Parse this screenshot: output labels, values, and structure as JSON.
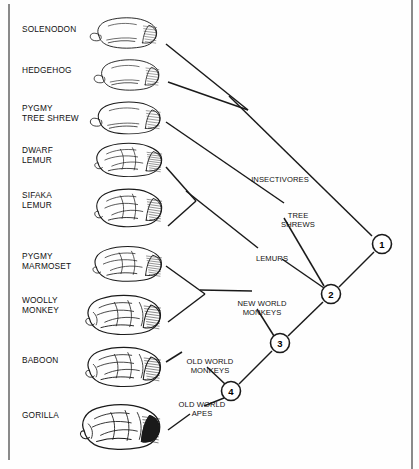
{
  "figure": {
    "type": "cladogram",
    "title": "",
    "background_color": "#fefefe",
    "line_color": "#1a1a1a",
    "text_color": "#111111"
  },
  "taxa": [
    {
      "id": "solenodon",
      "label": "SOLENODON",
      "label_x": 22,
      "label_y": 24,
      "brain_x": 88,
      "brain_y": 12,
      "brain_w": 78,
      "brain_h": 42,
      "tip_x": 166,
      "tip_y": 44
    },
    {
      "id": "hedgehog",
      "label": "HEDGEHOG",
      "label_x": 22,
      "label_y": 65,
      "brain_x": 92,
      "brain_y": 54,
      "brain_w": 76,
      "brain_h": 42,
      "tip_x": 168,
      "tip_y": 82
    },
    {
      "id": "pygmy-tree-shrew",
      "label": "PYGMY\nTREE SHREW",
      "label_x": 22,
      "label_y": 103,
      "brain_x": 88,
      "brain_y": 96,
      "brain_w": 82,
      "brain_h": 44,
      "tip_x": 166,
      "tip_y": 122
    },
    {
      "id": "dwarf-lemur",
      "label": "DWARF\nLEMUR",
      "label_x": 22,
      "label_y": 145,
      "brain_x": 86,
      "brain_y": 137,
      "brain_w": 86,
      "brain_h": 46,
      "tip_x": 166,
      "tip_y": 167
    },
    {
      "id": "sifaka-lemur",
      "label": "SIFAKA\nLEMUR",
      "label_x": 22,
      "label_y": 190,
      "brain_x": 86,
      "brain_y": 182,
      "brain_w": 86,
      "brain_h": 52,
      "tip_x": 168,
      "tip_y": 226
    },
    {
      "id": "pygmy-marmoset",
      "label": "PYGMY\nMARMOSET",
      "label_x": 22,
      "label_y": 251,
      "brain_x": 84,
      "brain_y": 240,
      "brain_w": 88,
      "brain_h": 48,
      "tip_x": 166,
      "tip_y": 266
    },
    {
      "id": "woolly-monkey",
      "label": "WOOLLY\nMONKEY",
      "label_x": 22,
      "label_y": 295,
      "brain_x": 76,
      "brain_y": 288,
      "brain_w": 96,
      "brain_h": 54,
      "tip_x": 168,
      "tip_y": 322
    },
    {
      "id": "baboon",
      "label": "BABOON",
      "label_x": 22,
      "label_y": 355,
      "brain_x": 76,
      "brain_y": 340,
      "brain_w": 96,
      "brain_h": 54,
      "tip_x": 166,
      "tip_y": 362
    },
    {
      "id": "gorilla",
      "label": "GORILLA",
      "label_x": 22,
      "label_y": 410,
      "brain_x": 70,
      "brain_y": 396,
      "brain_w": 102,
      "brain_h": 62,
      "tip_x": 168,
      "tip_y": 430
    }
  ],
  "clade_labels": [
    {
      "id": "insectivores",
      "text": "INSECTIVORES",
      "x": 280,
      "y": 175,
      "align": "center"
    },
    {
      "id": "tree-shrews",
      "text": "TREE\nSHREWS",
      "x": 298,
      "y": 211,
      "align": "center"
    },
    {
      "id": "lemurs",
      "text": "LEMURS",
      "x": 272,
      "y": 254,
      "align": "center"
    },
    {
      "id": "new-world-monkeys",
      "text": "NEW WORLD\nMONKEYS",
      "x": 262,
      "y": 299,
      "align": "center"
    },
    {
      "id": "old-world-monkeys",
      "text": "OLD WORLD\nMONKEYS",
      "x": 210,
      "y": 357,
      "align": "center"
    },
    {
      "id": "old-world-apes",
      "text": "OLD WORLD\nAPES",
      "x": 202,
      "y": 400,
      "align": "center"
    }
  ],
  "nodes": [
    {
      "id": "node-1",
      "number": "1",
      "x": 382,
      "y": 244,
      "r": 9.5
    },
    {
      "id": "node-2",
      "number": "2",
      "x": 331,
      "y": 294,
      "r": 9.5
    },
    {
      "id": "node-3",
      "number": "3",
      "x": 280,
      "y": 343,
      "r": 9.5
    },
    {
      "id": "node-4",
      "number": "4",
      "x": 231,
      "y": 391,
      "r": 9.5
    }
  ],
  "branches": [
    {
      "id": "branch-solenodon",
      "x1": 166,
      "y1": 44,
      "x2": 248,
      "y2": 110
    },
    {
      "id": "branch-hedgehog",
      "x1": 168,
      "y1": 82,
      "x2": 248,
      "y2": 110
    },
    {
      "id": "branch-insectivores",
      "x1": 229,
      "y1": 96,
      "x2": 372,
      "y2": 236
    },
    {
      "id": "branch-tree-shrew",
      "x1": 166,
      "y1": 122,
      "x2": 284,
      "y2": 203
    },
    {
      "id": "branch-tree-shrews-stem",
      "x1": 284,
      "y1": 218,
      "x2": 324,
      "y2": 286
    },
    {
      "id": "branch-dwarf-lemur",
      "x1": 166,
      "y1": 167,
      "x2": 196,
      "y2": 201
    },
    {
      "id": "branch-sifaka-lemur",
      "x1": 168,
      "y1": 226,
      "x2": 196,
      "y2": 201
    },
    {
      "id": "branch-lemurs",
      "x1": 186,
      "y1": 191,
      "x2": 258,
      "y2": 248
    },
    {
      "id": "branch-lemurs-stem",
      "x1": 282,
      "y1": 259,
      "x2": 324,
      "y2": 288
    },
    {
      "id": "branch-pygmy-marmoset",
      "x1": 166,
      "y1": 266,
      "x2": 205,
      "y2": 294
    },
    {
      "id": "branch-woolly-monkey",
      "x1": 168,
      "y1": 322,
      "x2": 205,
      "y2": 294
    },
    {
      "id": "branch-nwm-label",
      "x1": 200,
      "y1": 290,
      "x2": 252,
      "y2": 291
    },
    {
      "id": "branch-nwm-stem",
      "x1": 257,
      "y1": 309,
      "x2": 274,
      "y2": 336
    },
    {
      "id": "branch-baboon",
      "x1": 166,
      "y1": 362,
      "x2": 182,
      "y2": 352
    },
    {
      "id": "branch-owm-stem",
      "x1": 207,
      "y1": 367,
      "x2": 225,
      "y2": 384
    },
    {
      "id": "branch-gorilla",
      "x1": 168,
      "y1": 430,
      "x2": 190,
      "y2": 414
    },
    {
      "id": "branch-owa-stem",
      "x1": 204,
      "y1": 406,
      "x2": 224,
      "y2": 398
    },
    {
      "id": "branch-node4-node3",
      "x1": 239,
      "y1": 384,
      "x2": 272,
      "y2": 351
    },
    {
      "id": "branch-node3-node2",
      "x1": 288,
      "y1": 336,
      "x2": 323,
      "y2": 302
    },
    {
      "id": "branch-node2-node1",
      "x1": 339,
      "y1": 287,
      "x2": 374,
      "y2": 252
    }
  ]
}
